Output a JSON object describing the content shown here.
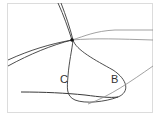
{
  "diagram": {
    "type": "curve-diagram",
    "labels": {
      "c": "C",
      "b": "B"
    },
    "colors": {
      "background": "#ffffff",
      "frame": "#dcdcdc",
      "dark_curve": "#3a3a3a",
      "light_curve": "#8a8a8a"
    },
    "nodes": [
      {
        "name": "intersection-point",
        "x": 72,
        "y": 40
      }
    ]
  }
}
